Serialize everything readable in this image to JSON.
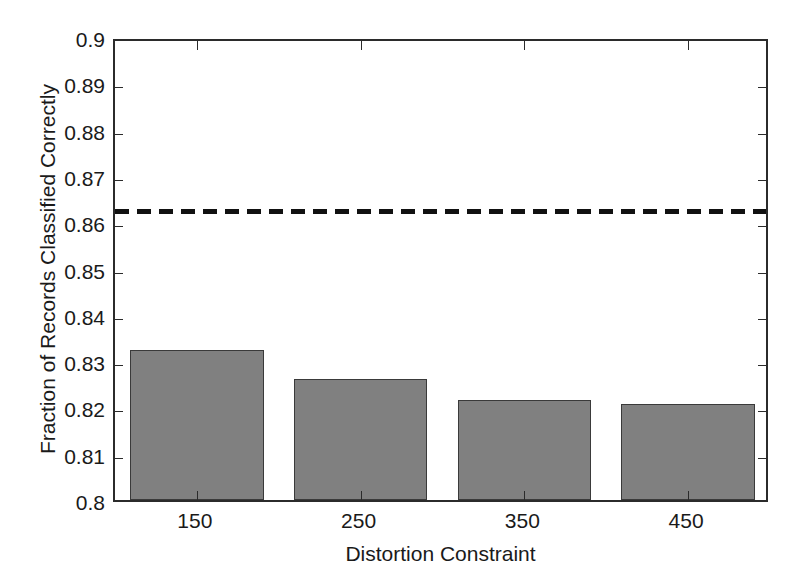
{
  "chart_data": {
    "type": "bar",
    "title": "",
    "xlabel": "Distortion Constraint",
    "ylabel": "Fraction of Records Classified Correctly",
    "categories": [
      "150",
      "250",
      "350",
      "450"
    ],
    "values": [
      0.8325,
      0.8262,
      0.8217,
      0.8208
    ],
    "series": [
      {
        "name": "Fraction of Records Classified Correctly",
        "values": [
          0.8325,
          0.8262,
          0.8217,
          0.8208
        ],
        "color": "#808080",
        "style": "bar"
      },
      {
        "name": "Baseline reference",
        "values": [
          0.8632,
          0.8632,
          0.8632,
          0.8632
        ],
        "color": "#111111",
        "style": "dashed-line"
      }
    ],
    "reference_line": {
      "value": 0.8632,
      "style": "dashed",
      "color": "#111111"
    },
    "ylim": [
      0.8,
      0.9
    ],
    "yticks": [
      0.8,
      0.81,
      0.82,
      0.83,
      0.84,
      0.85,
      0.86,
      0.87,
      0.88,
      0.89,
      0.9
    ],
    "ytick_labels": [
      "0.8",
      "0.81",
      "0.82",
      "0.83",
      "0.84",
      "0.85",
      "0.86",
      "0.87",
      "0.88",
      "0.89",
      "0.9"
    ],
    "xtick_labels": [
      "150",
      "250",
      "350",
      "450"
    ],
    "grid": false,
    "legend": "none",
    "bar_color": "#808080",
    "bar_edge_color": "#3a3a3a",
    "axis_color": "#2b2b2b",
    "background_color": "#ffffff"
  }
}
